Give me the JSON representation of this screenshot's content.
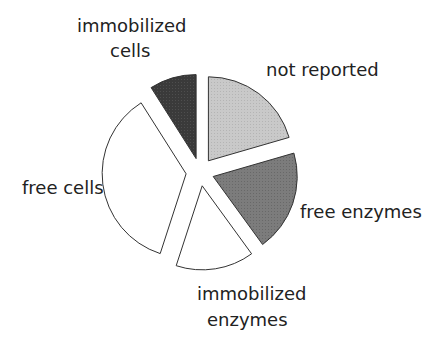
{
  "chart_data": {
    "type": "pie",
    "title": "",
    "exploded": true,
    "start_angle_deg": 0,
    "direction": "clockwise",
    "categories": [
      "not reported",
      "free enzymes",
      "immobilized enzymes",
      "free cells",
      "immobilized cells"
    ],
    "values": [
      20.5,
      19.5,
      15.0,
      36.0,
      9.0
    ],
    "unit": "percent (estimated from slice angles)",
    "colors": [
      "#c8c8c8",
      "#7a7a7a",
      "#ffffff",
      "#ffffff",
      "#3a3a3a"
    ],
    "label_lines": [
      [
        "not reported"
      ],
      [
        "free enzymes"
      ],
      [
        "immobilized",
        "enzymes"
      ],
      [
        "free cells"
      ],
      [
        "immobilized",
        "cells"
      ]
    ],
    "legend": "none (direct labels)"
  },
  "layout": {
    "center": [
      200,
      172
    ],
    "radius": 84,
    "explode": 14,
    "label_positions": [
      [
        [
          266,
          76
        ]
      ],
      [
        [
          300,
          218
        ]
      ],
      [
        [
          197,
          300
        ],
        [
          207,
          326
        ]
      ],
      [
        [
          22,
          194
        ]
      ],
      [
        [
          77,
          32
        ],
        [
          110,
          57
        ]
      ]
    ]
  }
}
